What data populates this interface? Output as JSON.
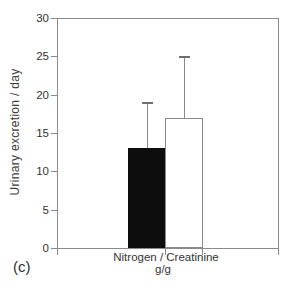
{
  "chart_data": {
    "type": "bar",
    "categories": [
      "Nitrogen / Creatinine"
    ],
    "category_sublabel": "g/g",
    "ylabel": "Urinary excretion / day",
    "ylim": [
      0,
      30
    ],
    "yticks": [
      0,
      5,
      10,
      15,
      20,
      25,
      30
    ],
    "grid": false,
    "legend": "none",
    "frame": "full-box",
    "series": [
      {
        "name": "black-filled-bar",
        "values": [
          13
        ],
        "error_upper": [
          19
        ],
        "fill": "#0d0d0d"
      },
      {
        "name": "white-open-bar",
        "values": [
          17
        ],
        "error_upper": [
          25
        ],
        "fill": "#ffffff"
      }
    ],
    "panel_label": "(c)"
  },
  "colors": {
    "frame": "#8a8a8a",
    "text": "#3a3a3a",
    "bar_black": "#0d0d0d",
    "bar_white": "#ffffff",
    "background": "#ffffff"
  }
}
